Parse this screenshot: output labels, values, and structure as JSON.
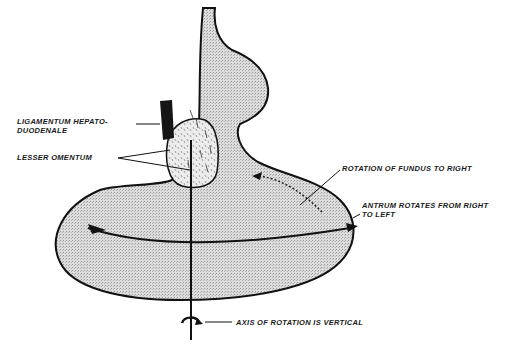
{
  "diagram": {
    "type": "anatomical-illustration",
    "colors": {
      "outline": "#111111",
      "fill": "#d6d6d6",
      "omentum_fill": "#e8e8e8",
      "background": "#ffffff"
    },
    "labels": {
      "ligamentum_line1": "LIGAMENTUM HEPATO-",
      "ligamentum_line2": "DUODENALE",
      "lesser_omentum": "LESSER OMENTUM",
      "fundus_rotation": "ROTATION OF FUNDUS TO RIGHT",
      "antrum_line1": "ANTRUM ROTATES FROM RIGHT",
      "antrum_line2": "TO LEFT",
      "axis": "AXIS OF ROTATION IS VERTICAL"
    }
  }
}
